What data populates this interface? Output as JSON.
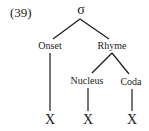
{
  "example_number": "(39)",
  "tree": {
    "root": {
      "label": "σ",
      "x": 81,
      "y": 4
    },
    "nodes": [
      {
        "id": "onset",
        "label": "Onset",
        "x": 50,
        "y": 41
      },
      {
        "id": "rhyme",
        "label": "Rhyme",
        "x": 112,
        "y": 41
      },
      {
        "id": "nucleus",
        "label": "Nucleus",
        "x": 87,
        "y": 76
      },
      {
        "id": "coda",
        "label": "Coda",
        "x": 131,
        "y": 77
      }
    ],
    "leaves": [
      {
        "id": "x1",
        "label": "X",
        "x": 50,
        "y": 113
      },
      {
        "id": "x2",
        "label": "X",
        "x": 88,
        "y": 113
      },
      {
        "id": "x3",
        "label": "X",
        "x": 132,
        "y": 113
      }
    ]
  },
  "colors": {
    "line": "#1a1a1a",
    "text": "#1a1a1a",
    "background": "#ffffff"
  }
}
